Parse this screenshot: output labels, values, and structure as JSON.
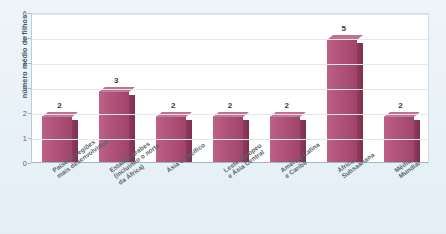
{
  "chart_data": {
    "type": "bar",
    "title": "",
    "subtitle": "",
    "xlabel": "",
    "ylabel": "número médio de filhos",
    "ylim": [
      0,
      6
    ],
    "ytick_labels": [
      "0",
      "1",
      "2",
      "3",
      "4",
      "5",
      "6"
    ],
    "ytick_values": [
      0,
      1,
      2,
      3,
      4,
      5,
      6
    ],
    "grid": true,
    "legend": false,
    "legend_position": "none",
    "categories": [
      "Países e regiões\nmais desenvolvidos",
      "Estados árabes\n(incluindo o norte\nda África)",
      "Ásia e Pacífico",
      "Leste Europeu\ne Ásia Central",
      "América Latina\ne Caribe",
      "África\nSubsaariana",
      "Média\nMundial"
    ],
    "values": [
      1.8,
      2.8,
      1.8,
      1.8,
      1.8,
      4.9,
      1.8
    ],
    "data_labels": [
      "2",
      "3",
      "2",
      "2",
      "2",
      "5",
      "2"
    ],
    "bar_color": "#b1557b",
    "bar_side_color": "#823252",
    "bar_top_color": "#c4708f",
    "plot_background": "#ffffff",
    "figure_background": "#eaf2f8",
    "grid_color": "#dfe9f0",
    "axis_color": "#9fb6c6",
    "text_color": "#59646f"
  }
}
